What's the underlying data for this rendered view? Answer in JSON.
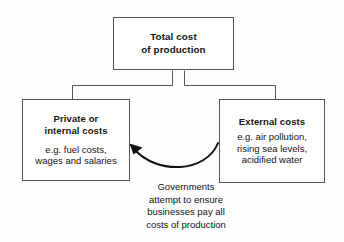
{
  "diagram": {
    "title": "Total cost of production",
    "background_color": "#fdfdfd",
    "line_color": "#555555",
    "text_color": "#141414",
    "nodes": {
      "total_cost": {
        "title": "Total cost\nof production"
      },
      "private_costs": {
        "title": "Private or\ninternal costs",
        "detail": "e.g. fuel costs,\nwages and salaries"
      },
      "external_costs": {
        "title": "External costs",
        "detail": "e.g. air pollution,\nrising sea levels,\nacidified water"
      }
    },
    "arrow": {
      "caption": "Governments\nattempt to ensure\nbusinesses pay all\ncosts of production",
      "direction": "external-costs-to-private-costs"
    }
  }
}
